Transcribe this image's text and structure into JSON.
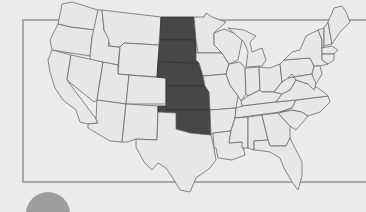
{
  "map": {
    "title": "United States map",
    "subject": "Contiguous United States with highlighted Great Plains states",
    "highlight_color": "#474747",
    "base_color": "#e7e7e7",
    "border_color": "#6a6a6a",
    "frame_color": "#a9a9a9",
    "background_color": "#ebebeb",
    "highlighted_states": [
      "North Dakota",
      "South Dakota",
      "Nebraska",
      "Kansas",
      "Oklahoma"
    ],
    "legend_marker": {
      "shape": "circle",
      "color": "#9d9d9d",
      "partial": true
    }
  }
}
